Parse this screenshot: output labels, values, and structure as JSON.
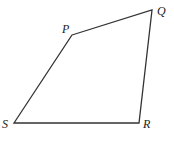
{
  "figure": {
    "type": "quadrilateral",
    "stroke_color": "#333333",
    "vertices": [
      {
        "name": "P",
        "x": 72,
        "y": 35,
        "label_x": 62,
        "label_y": 33
      },
      {
        "name": "Q",
        "x": 152,
        "y": 10,
        "label_x": 157,
        "label_y": 15
      },
      {
        "name": "R",
        "x": 139,
        "y": 123,
        "label_x": 143,
        "label_y": 128
      },
      {
        "name": "S",
        "x": 14,
        "y": 123,
        "label_x": 2,
        "label_y": 128
      }
    ],
    "edges": [
      "PQ",
      "QR",
      "RS",
      "SP"
    ]
  }
}
